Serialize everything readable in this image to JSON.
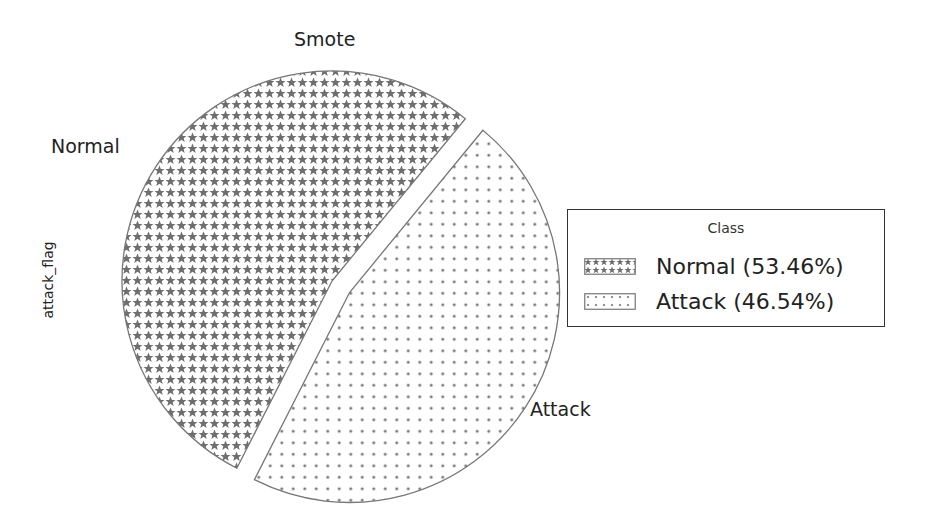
{
  "chart_data": {
    "type": "pie",
    "title": "Smote",
    "ylabel": "attack_flag",
    "categories": [
      "Normal",
      "Attack"
    ],
    "values": [
      53.46,
      46.54
    ],
    "explode": [
      0,
      0.1
    ],
    "hatches": [
      "stars",
      "dots"
    ],
    "legend": {
      "title": "Class",
      "position": "right",
      "entries": [
        "Normal (53.46%)",
        "Attack (46.54%)"
      ]
    }
  },
  "labels": {
    "title": "Smote",
    "ylabel": "attack_flag",
    "slice_normal": "Normal",
    "slice_attack": "Attack",
    "legend_title": "Class",
    "legend_normal": "Normal (53.46%)",
    "legend_attack": "Attack (46.54%)"
  },
  "colors": {
    "hatch": "#6e6e6e",
    "edge": "#777777"
  }
}
